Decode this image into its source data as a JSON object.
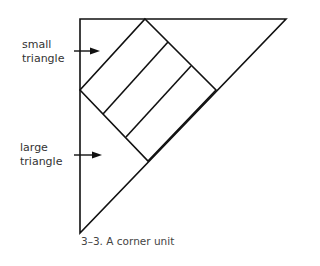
{
  "labels": {
    "small": [
      "small",
      "triangle"
    ],
    "large": [
      "large",
      "triangle"
    ]
  },
  "caption": "3–3. A corner unit",
  "colors": {
    "stroke": "#111111"
  }
}
